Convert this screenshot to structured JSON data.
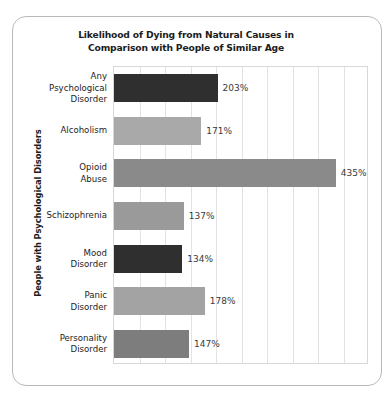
{
  "card": {
    "name": "chart-card"
  },
  "chart_data": {
    "type": "bar",
    "orientation": "horizontal",
    "title": "Likelihood of Dying from Natural Causes in Comparison with People of Similar Age",
    "title_line1": "Likelihood of Dying from Natural Causes in",
    "title_line2": "Comparison with People of Similar Age",
    "ylabel": "People with Psychological Disorders",
    "xlabel": "",
    "xlim": [
      0,
      500
    ],
    "grid": true,
    "gridline_interval": 50,
    "legend": "none",
    "tick_labels_shown": false,
    "categories": [
      "Any Psychological Disorder",
      "Alcoholism",
      "Opioid Abuse",
      "Schizophrenia",
      "Mood Disorder",
      "Panic Disorder",
      "Personality Disorder"
    ],
    "category_lines": [
      [
        "Any",
        "Psychological",
        "Disorder"
      ],
      [
        "Alcoholism"
      ],
      [
        "Opioid",
        "Abuse"
      ],
      [
        "Schizophrenia"
      ],
      [
        "Mood",
        "Disorder"
      ],
      [
        "Panic",
        "Disorder"
      ],
      [
        "Personality",
        "Disorder"
      ]
    ],
    "values": [
      203,
      171,
      435,
      137,
      134,
      178,
      147
    ],
    "value_labels": [
      "203%",
      "171%",
      "435%",
      "137%",
      "134%",
      "178%",
      "147%"
    ],
    "bar_colors": [
      "#2f2f2f",
      "#a9a9a9",
      "#8a8a8a",
      "#9a9a9a",
      "#2f2f2f",
      "#a3a3a3",
      "#7d7d7d"
    ],
    "colors": {
      "dark_bar": "#2f2f2f",
      "light_gray_bar": "#a9a9a9",
      "mid_gray_bar": "#8a8a8a",
      "gridline": "#e3e3e3",
      "plot_border": "#d8d8d8",
      "card_border": "#b9b9b9",
      "text": "#1c1c1c",
      "value_text": "#3a3a3a",
      "background": "#ffffff"
    }
  }
}
